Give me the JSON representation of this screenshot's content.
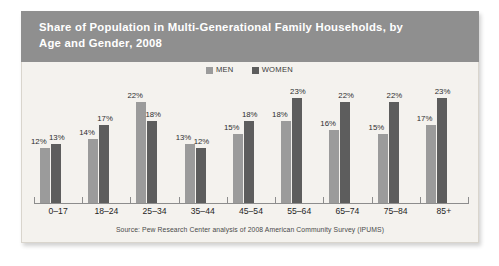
{
  "figure": {
    "title_line1": "Share of Population in Multi-Generational Family Households, by",
    "title_line2": "Age and Gender, 2008",
    "title_band_color": "#8f8f8f",
    "card_background": "#f4f2ee"
  },
  "legend": {
    "items": [
      {
        "label": "MEN",
        "color": "#9b9b9b",
        "swatch_name": "legend-swatch-men"
      },
      {
        "label": "WOMEN",
        "color": "#5d5d5d",
        "swatch_name": "legend-swatch-women"
      }
    ]
  },
  "source_note": "Source: Pew Research Center analysis of 2008 American Community Survey (IPUMS)",
  "chart_data": {
    "type": "bar",
    "title": "Share of Population in Multi-Generational Family Households, by Age and Gender, 2008",
    "subtitle": "",
    "xlabel": "",
    "ylabel": "",
    "ylim": [
      0,
      26
    ],
    "grid": false,
    "legend_position": "top-center",
    "value_suffix": "%",
    "categories": [
      "0–17",
      "18–24",
      "25–34",
      "35–44",
      "45–54",
      "55–64",
      "65–74",
      "75–84",
      "85+"
    ],
    "series": [
      {
        "name": "MEN",
        "color": "#9b9b9b",
        "values": [
          12,
          14,
          22,
          13,
          15,
          18,
          16,
          15,
          17
        ]
      },
      {
        "name": "WOMEN",
        "color": "#5d5d5d",
        "values": [
          13,
          17,
          18,
          12,
          18,
          23,
          22,
          22,
          23
        ]
      }
    ],
    "labels": {
      "MEN": [
        "12%",
        "14%",
        "22%",
        "13%",
        "15%",
        "18%",
        "16%",
        "15%",
        "17%"
      ],
      "WOMEN": [
        "13%",
        "17%",
        "18%",
        "12%",
        "18%",
        "23%",
        "22%",
        "22%",
        "23%"
      ]
    },
    "source": "Source: Pew Research Center analysis of 2008 American Community Survey (IPUMS)"
  }
}
